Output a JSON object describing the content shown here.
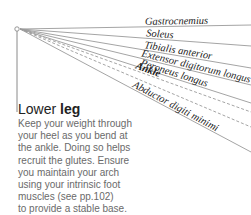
{
  "diagram": {
    "origin": {
      "x": 17,
      "y": 29
    },
    "lines": [
      {
        "label": "Gastrocnemius",
        "end_y": 25,
        "style": "solid",
        "bold": false
      },
      {
        "label": "Soleus",
        "end_y": 46,
        "style": "solid",
        "bold": false
      },
      {
        "label": "Tibialis anterior",
        "end_y": 68,
        "style": "solid",
        "bold": false
      },
      {
        "label": "Extensor digitorum longus",
        "end_y": 85,
        "style": "solid",
        "bold": false
      },
      {
        "label": "Peroneus longus",
        "end_y": 103,
        "style": "solid",
        "bold": false
      },
      {
        "label": "Ankle",
        "end_y": 112,
        "style": "dashed",
        "bold": true
      },
      {
        "label": "Abductor digiti minimi",
        "end_y": 152,
        "style": "solid",
        "bold": false
      }
    ],
    "colors": {
      "line": "#9a9a9a",
      "text": "#222222",
      "body": "#6a6a6a"
    }
  },
  "section": {
    "heading_light": "Lower ",
    "heading_bold": "leg",
    "body_lines": [
      "Keep your weight through",
      "your heel as you bend at",
      "the ankle. Doing so helps",
      "recruit the glutes. Ensure",
      "you maintain your arch",
      "using your intrinsic foot",
      "muscles (see pp.102)",
      "to provide a stable base."
    ]
  }
}
